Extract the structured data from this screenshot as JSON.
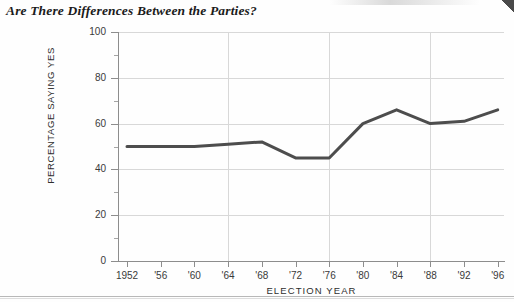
{
  "chart_title": "Are There Differences Between the Parties?",
  "axes": {
    "x_title": "ELECTION  YEAR",
    "y_title": "PERCENTAGE SAYING YES"
  },
  "chart_data": {
    "type": "line",
    "title": "Are There Differences Between the Parties?",
    "xlabel": "ELECTION  YEAR",
    "ylabel": "PERCENTAGE SAYING YES",
    "categories": [
      "1952",
      "'56",
      "'60",
      "'64",
      "'68",
      "'72",
      "'76",
      "'80",
      "'84",
      "'88",
      "'92",
      "'96"
    ],
    "x_values": [
      1952,
      1956,
      1960,
      1964,
      1968,
      1972,
      1976,
      1980,
      1984,
      1988,
      1992,
      1996
    ],
    "values": [
      50,
      50,
      50,
      51,
      52,
      45,
      45,
      60,
      66,
      60,
      61,
      66
    ],
    "series": [
      {
        "name": "Percentage saying yes",
        "values": [
          50,
          50,
          50,
          51,
          52,
          45,
          45,
          60,
          66,
          60,
          61,
          66
        ],
        "color": "#4d4d4d"
      }
    ],
    "ylim": [
      0,
      100
    ],
    "ytick_values": [
      0,
      20,
      40,
      60,
      80,
      100
    ],
    "ytick_labels": [
      "0",
      "20",
      "40",
      "60",
      "80",
      "100"
    ],
    "yminor_tick_values": [
      10,
      30,
      50,
      70,
      90
    ],
    "gridline_x_categories": [
      "'64",
      "'76",
      "'88"
    ],
    "grid": "both",
    "legend": "none",
    "line_color": "#4d4d4d",
    "grid_color": "#d8d8d8",
    "axis_color": "#8d8d8d"
  }
}
